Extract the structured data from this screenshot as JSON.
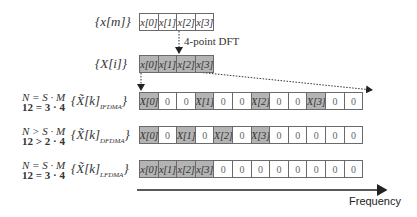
{
  "colors": {
    "filled_cell": "#b4b4b4",
    "empty_cell": "#ffffff",
    "border": "#6a6a6a",
    "arrow": "#222222"
  },
  "input_sequence": {
    "label": "{x[m]}",
    "cells": [
      {
        "text": "x[0]",
        "filled": false
      },
      {
        "text": "x[1]",
        "filled": false
      },
      {
        "text": "x[2]",
        "filled": false
      },
      {
        "text": "x[3]",
        "filled": false
      }
    ]
  },
  "dft": {
    "label": "4-point DFT"
  },
  "dft_output": {
    "label": "{X[i]}",
    "cells": [
      {
        "text": "x[0]",
        "filled": true
      },
      {
        "text": "x[1]",
        "filled": true
      },
      {
        "text": "x[2]",
        "filled": true
      },
      {
        "text": "x[3]",
        "filled": true
      }
    ]
  },
  "mappings": [
    {
      "name": "IFDMA",
      "eq_line1": "N = S · M",
      "eq_line2": "12 = 3 · 4",
      "set_label": "{X̃[k]",
      "subscript": "IFDMA",
      "set_close": "}",
      "cells": [
        {
          "text": "X[0]",
          "filled": true
        },
        {
          "text": "0",
          "filled": false
        },
        {
          "text": "0",
          "filled": false
        },
        {
          "text": "X[1]",
          "filled": true
        },
        {
          "text": "0",
          "filled": false
        },
        {
          "text": "0",
          "filled": false
        },
        {
          "text": "X[2]",
          "filled": true
        },
        {
          "text": "0",
          "filled": false
        },
        {
          "text": "0",
          "filled": false
        },
        {
          "text": "X[3]",
          "filled": true
        },
        {
          "text": "0",
          "filled": false
        },
        {
          "text": "0",
          "filled": false
        }
      ]
    },
    {
      "name": "DFDMA",
      "eq_line1": "N > S · M",
      "eq_line2": "12 > 2 · 4",
      "set_label": "{X̃[k]",
      "subscript": "DFDMA",
      "set_close": "}",
      "cells": [
        {
          "text": "X[0]",
          "filled": true
        },
        {
          "text": "0",
          "filled": false
        },
        {
          "text": "X[1]",
          "filled": true
        },
        {
          "text": "0",
          "filled": false
        },
        {
          "text": "X[2]",
          "filled": true
        },
        {
          "text": "0",
          "filled": false
        },
        {
          "text": "X[3]",
          "filled": true
        },
        {
          "text": "0",
          "filled": false
        },
        {
          "text": "0",
          "filled": false
        },
        {
          "text": "0",
          "filled": false
        },
        {
          "text": "0",
          "filled": false
        },
        {
          "text": "0",
          "filled": false
        }
      ]
    },
    {
      "name": "LFDMA",
      "eq_line1": "N = S · M",
      "eq_line2": "12 = 3 · 4",
      "set_label": "{X̃[k]",
      "subscript": "LFDMA",
      "set_close": "}",
      "cells": [
        {
          "text": "x[0]",
          "filled": true
        },
        {
          "text": "x[1]",
          "filled": true
        },
        {
          "text": "x[2]",
          "filled": true
        },
        {
          "text": "x[3]",
          "filled": true
        },
        {
          "text": "0",
          "filled": false
        },
        {
          "text": "0",
          "filled": false
        },
        {
          "text": "0",
          "filled": false
        },
        {
          "text": "0",
          "filled": false
        },
        {
          "text": "0",
          "filled": false
        },
        {
          "text": "0",
          "filled": false
        },
        {
          "text": "0",
          "filled": false
        },
        {
          "text": "0",
          "filled": false
        }
      ]
    }
  ],
  "axis": {
    "label": "Frequency"
  }
}
